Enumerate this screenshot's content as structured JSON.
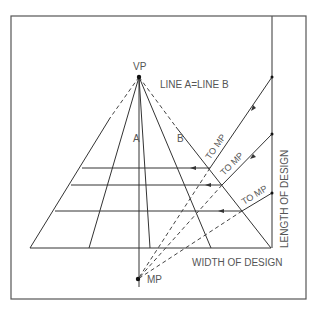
{
  "diagram": {
    "colors": {
      "line": "#333333",
      "frame": "#555555",
      "text": "#555555",
      "background": "#ffffff"
    },
    "labels": {
      "vp": "VP",
      "mp": "MP",
      "line_ab": "LINE A=LINE B",
      "a": "A",
      "b": "B",
      "to_mp_1": "TO MP",
      "to_mp_2": "TO MP",
      "to_mp_3": "TO MP",
      "width": "WIDTH OF DESIGN",
      "length": "LENGTH OF DESIGN"
    },
    "points": {
      "vp": [
        139,
        77
      ],
      "mp": [
        138,
        279
      ],
      "base_left": [
        30,
        248
      ],
      "base_right": [
        271,
        248
      ]
    },
    "frame": {
      "x": 11,
      "y": 16,
      "width": 295,
      "height": 283
    },
    "measure_line_x": 272,
    "horizontal_lines_y": [
      168,
      185,
      211,
      248
    ],
    "base_intersections_x": [
      30,
      89,
      139,
      150,
      211,
      271
    ],
    "measure_marks_y": [
      77,
      134,
      193
    ]
  }
}
